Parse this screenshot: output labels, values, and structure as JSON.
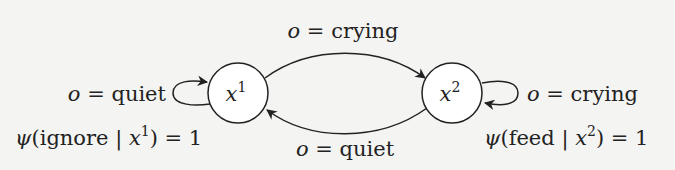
{
  "diagram": {
    "type": "state-transition",
    "background": "#f4f4f2",
    "stroke_color": "#222222",
    "nodes": [
      {
        "id": "x1",
        "base": "x",
        "sup": "1",
        "cx": 238,
        "cy": 93,
        "r": 30
      },
      {
        "id": "x2",
        "base": "x",
        "sup": "2",
        "cx": 452,
        "cy": 93,
        "r": 30
      }
    ],
    "edges": [
      {
        "from": "x1",
        "to": "x2",
        "label": {
          "var": "o",
          "eq": " = ",
          "value": "crying"
        },
        "position": "top-arc"
      },
      {
        "from": "x2",
        "to": "x1",
        "label": {
          "var": "o",
          "eq": " = ",
          "value": "quiet"
        },
        "position": "bottom-arc"
      },
      {
        "from": "x1",
        "to": "x1",
        "label": {
          "var": "o",
          "eq": " = ",
          "value": "quiet"
        },
        "position": "left-self-loop"
      },
      {
        "from": "x2",
        "to": "x2",
        "label": {
          "var": "o",
          "eq": " = ",
          "value": "crying"
        },
        "position": "right-self-loop"
      }
    ],
    "policies": [
      {
        "node": "x1",
        "psi": "ψ",
        "open": "(",
        "action": "ignore",
        "bar": " | ",
        "state_base": "x",
        "state_sup": "1",
        "close": ")",
        "eq": " = ",
        "value": "1"
      },
      {
        "node": "x2",
        "psi": "ψ",
        "open": "(",
        "action": "feed",
        "bar": " | ",
        "state_base": "x",
        "state_sup": "2",
        "close": ")",
        "eq": " = ",
        "value": "1"
      }
    ]
  }
}
